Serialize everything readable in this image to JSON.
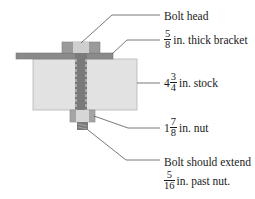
{
  "diagram": {
    "colors": {
      "bracket": "#8a8a8a",
      "stock": "#e2e2e2",
      "bolt_head_outer": "#9a9a9a",
      "bolt_head_center": "#cfcfcf",
      "shaft": "#777777",
      "nut_outer": "#a5a5a5",
      "nut_center": "#d6d6d6",
      "leader_line": "#555555"
    },
    "labels": {
      "bolt_head": {
        "text": "Bolt head"
      },
      "bracket": {
        "num": "5",
        "den": "8",
        "text": "in. thick bracket"
      },
      "stock": {
        "whole": "4",
        "num": "3",
        "den": "4",
        "text": "in. stock"
      },
      "nut": {
        "whole": "1",
        "num": "7",
        "den": "8",
        "text": "in. nut"
      },
      "extension": {
        "line1": "Bolt should extend",
        "num": "5",
        "den": "16",
        "text": "in. past nut."
      }
    }
  }
}
